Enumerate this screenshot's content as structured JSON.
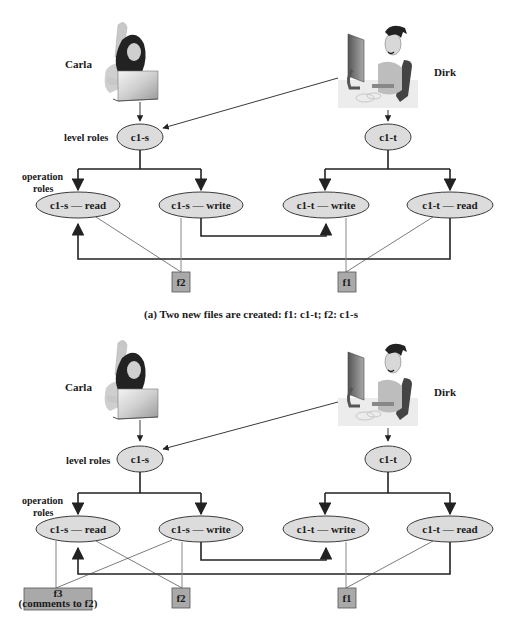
{
  "colors": {
    "node_fill": "#dcdcdc",
    "node_stroke": "#3a3a3a",
    "file_fill": "#a9a9a9",
    "line": "#222222",
    "thin_line": "#555555"
  },
  "panels": [
    {
      "id": "a",
      "users": [
        {
          "name": "Carla"
        },
        {
          "name": "Dirk"
        }
      ],
      "row_labels": {
        "level": "level roles",
        "operation_1": "operation",
        "operation_2": "roles"
      },
      "level_roles": [
        "c1-s",
        "c1-t"
      ],
      "operation_roles": [
        "c1-s — read",
        "c1-s — write",
        "c1-t — write",
        "c1-t — read"
      ],
      "files": [
        {
          "label": "f2"
        },
        {
          "label": "f1"
        }
      ],
      "caption": "(a) Two new files are created: f1: c1-t; f2: c1-s"
    },
    {
      "id": "b",
      "users": [
        {
          "name": "Carla"
        },
        {
          "name": "Dirk"
        }
      ],
      "row_labels": {
        "level": "level roles",
        "operation_1": "operation",
        "operation_2": "roles"
      },
      "level_roles": [
        "c1-s",
        "c1-t"
      ],
      "operation_roles": [
        "c1-s — read",
        "c1-s — write",
        "c1-t — write",
        "c1-t — read"
      ],
      "files": [
        {
          "label": "f3",
          "sublabel": "(comments to f2)"
        },
        {
          "label": "f2"
        },
        {
          "label": "f1"
        }
      ]
    }
  ]
}
